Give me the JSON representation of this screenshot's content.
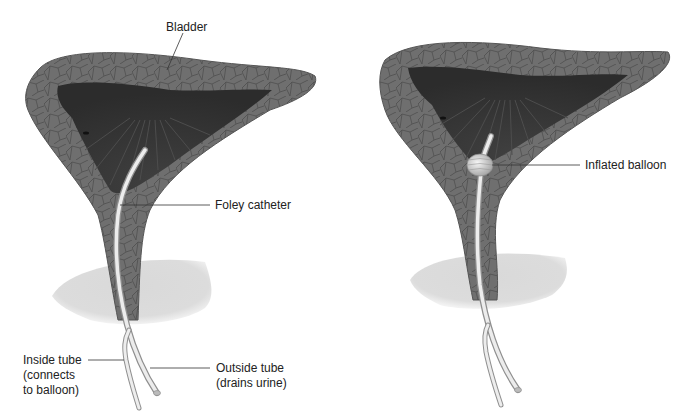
{
  "figure": {
    "panels": [
      {
        "id": "deflated",
        "labels": {
          "bladder": "Bladder",
          "catheter": "Foley catheter",
          "inside_tube": [
            "Inside tube",
            "(connects",
            "to balloon)"
          ],
          "outside_tube": [
            "Outside tube",
            "(drains urine)"
          ]
        }
      },
      {
        "id": "inflated",
        "labels": {
          "balloon": "Inflated balloon"
        }
      }
    ]
  },
  "colors": {
    "bladder_wall": "#6f6f6f",
    "bladder_wall_line": "#4e4e4e",
    "bladder_interior": "#353535",
    "interior_fold": "#4a4a4a",
    "prostate": "#d4d4d4",
    "catheter": "#e6e6e6",
    "catheter_edge": "#9a9a9a",
    "leader": "#333333",
    "text": "#222222"
  }
}
